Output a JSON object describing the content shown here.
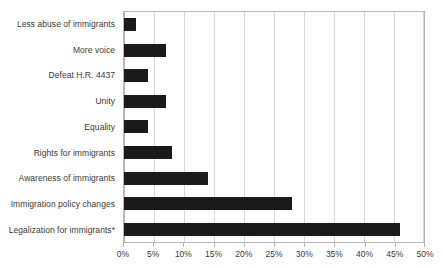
{
  "chart_data": {
    "type": "bar",
    "orientation": "horizontal",
    "title": "",
    "subtitle": "",
    "xlabel": "",
    "ylabel": "",
    "categories": [
      "Less abuse of immigrants",
      "More voice",
      "Defeat H.R. 4437",
      "Unity",
      "Equality",
      "Rights for immigrants",
      "Awareness of immigrants",
      "Immigration policy changes",
      "Legalization for immigrants*"
    ],
    "values": [
      2,
      7,
      4,
      7,
      4,
      8,
      14,
      28,
      46
    ],
    "value_suffix": "%",
    "xlim": [
      0,
      50
    ],
    "xticks": [
      0,
      5,
      10,
      15,
      20,
      25,
      30,
      35,
      40,
      45,
      50
    ],
    "xtick_labels": [
      "0%",
      "5%",
      "10%",
      "15%",
      "20%",
      "25%",
      "30%",
      "35%",
      "40%",
      "45%",
      "50%"
    ],
    "grid": true,
    "grid_axis": "x",
    "legend": false,
    "legend_position": "none",
    "series": [
      {
        "name": "",
        "values": [
          2,
          7,
          4,
          7,
          4,
          8,
          14,
          28,
          46
        ]
      }
    ],
    "colors": {
      "bar": "#1a1a1a",
      "gridline": "#d9d9d9",
      "border": "#b6b6b6",
      "text": "#3a3a3a",
      "background": "#ffffff"
    }
  }
}
